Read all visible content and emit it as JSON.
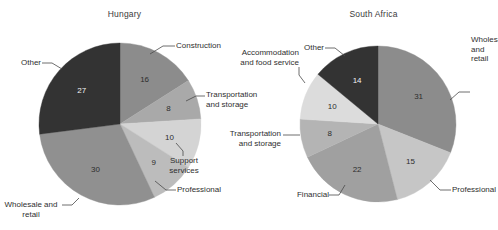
{
  "figure": {
    "background": "#ffffff",
    "width": 498,
    "height": 230
  },
  "chart_data": [
    {
      "type": "pie",
      "title": "Hungary",
      "xlabel": "",
      "ylabel": "",
      "legend": "none",
      "grid": false,
      "labels_position": "callout-outside-with-value-inside",
      "start_angle_deg": 0,
      "direction": "clockwise",
      "total": 100,
      "categories": [
        "Construction",
        "Transportation and storage",
        "Support services",
        "Professional",
        "Wholesale and retail",
        "Other"
      ],
      "values": [
        16,
        8,
        10,
        9,
        30,
        27
      ],
      "colors": [
        "#8c8c8c",
        "#a9a9a9",
        "#d4d4d4",
        "#bcbcbc",
        "#909090",
        "#333333"
      ],
      "value_text_colors": [
        "dark",
        "dark",
        "dark",
        "dark",
        "dark",
        "light"
      ]
    },
    {
      "type": "pie",
      "title": "South Africa",
      "xlabel": "",
      "ylabel": "",
      "legend": "none",
      "grid": false,
      "labels_position": "callout-outside-with-value-inside",
      "start_angle_deg": 0,
      "direction": "clockwise",
      "total": 100,
      "categories": [
        "Wholesale and retail",
        "Professional",
        "Financial",
        "Transportation and storage",
        "Accommodation and food service",
        "Other"
      ],
      "values": [
        31,
        15,
        22,
        8,
        10,
        14
      ],
      "colors": [
        "#8c8c8c",
        "#c6c6c6",
        "#a0a0a0",
        "#b4b4b4",
        "#dcdcdc",
        "#333333"
      ],
      "value_text_colors": [
        "dark",
        "dark",
        "dark",
        "dark",
        "dark",
        "light"
      ]
    }
  ],
  "hungary": {
    "title": "Hungary",
    "values": {
      "construction": "16",
      "transportation_and_storage": "8",
      "support_services": "10",
      "professional": "9",
      "wholesale_and_retail": "30",
      "other": "27"
    },
    "labels": {
      "construction": "Construction",
      "transportation_and_storage": "Transportation\nand storage",
      "support_services": "Support\nservices",
      "professional": "Professional",
      "wholesale_and_retail": "Wholesale and\nretail",
      "other": "Other"
    }
  },
  "south_africa": {
    "title": "South Africa",
    "values": {
      "wholesale_and_retail": "31",
      "professional": "15",
      "financial": "22",
      "transportation_and_storage": "8",
      "accommodation_and_food_service": "10",
      "other": "14"
    },
    "labels": {
      "wholesale_and_retail": "Wholesale and\nretail",
      "professional": "Professional",
      "financial": "Financial",
      "transportation_and_storage": "Transportation\nand storage",
      "accommodation_and_food_service": "Accommodation\nand food service",
      "other": "Other"
    }
  }
}
